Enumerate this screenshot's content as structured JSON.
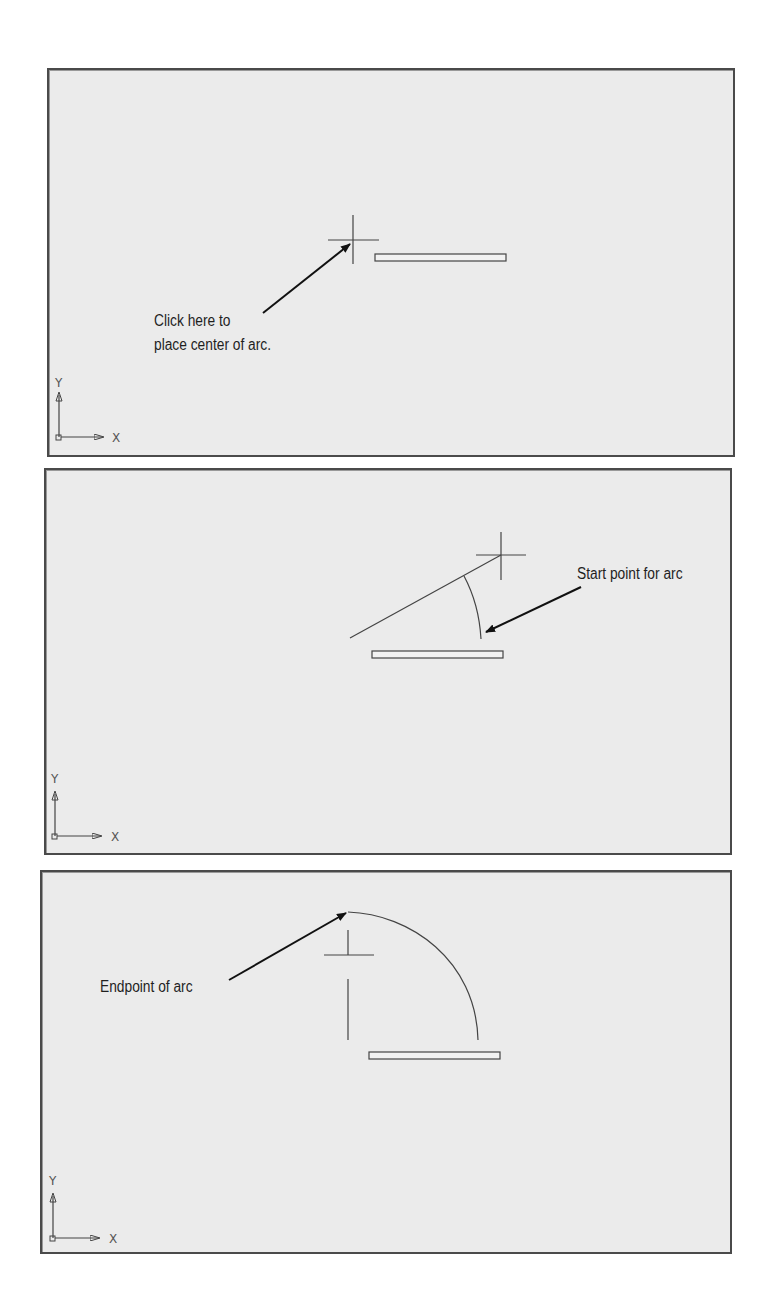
{
  "figure": {
    "panels": [
      {
        "id": "panel-1",
        "caption_lines": [
          "Click here to",
          "place center of arc."
        ],
        "ucs": {
          "x_label": "X",
          "y_label": "Y"
        }
      },
      {
        "id": "panel-2",
        "caption_lines": [
          "Start point for arc"
        ],
        "ucs": {
          "x_label": "X",
          "y_label": "Y"
        }
      },
      {
        "id": "panel-3",
        "caption_lines": [
          "Endpoint of arc"
        ],
        "ucs": {
          "x_label": "X",
          "y_label": "Y"
        }
      }
    ],
    "colors": {
      "panel_background": "#ebebeb",
      "border": "#4a4a4a",
      "line": "#444444",
      "arrow": "#111111"
    }
  }
}
